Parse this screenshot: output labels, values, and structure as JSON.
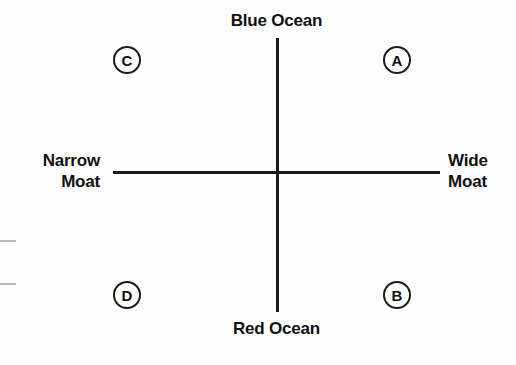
{
  "chart_data": {
    "type": "scatter",
    "title": "",
    "subtitle": "",
    "xlabel": "",
    "ylabel": "",
    "grid": false,
    "legend_position": "none",
    "axes": {
      "horizontal": {
        "left_pole": "Narrow\nMoat",
        "right_pole": "Wide\nMoat"
      },
      "vertical": {
        "top_pole": "Blue Ocean",
        "bottom_pole": "Red Ocean"
      }
    },
    "quadrant_markers": [
      {
        "label": "A",
        "quadrant": "top-right",
        "x": 0.62,
        "y": 0.58
      },
      {
        "label": "B",
        "quadrant": "bottom-right",
        "x": 0.62,
        "y": -0.52
      },
      {
        "label": "C",
        "quadrant": "top-left",
        "x": -0.62,
        "y": 0.58
      },
      {
        "label": "D",
        "quadrant": "bottom-left",
        "x": -0.62,
        "y": -0.52
      }
    ],
    "edge_ticks": 2
  },
  "matrix": {
    "poles": {
      "top": "Blue Ocean",
      "bottom": "Red Ocean",
      "left": "Narrow\nMoat",
      "right": "Wide\nMoat"
    },
    "markers": {
      "a": "A",
      "b": "B",
      "c": "C",
      "d": "D"
    }
  },
  "colors": {
    "axis": "#1a1a1a",
    "text": "#111111",
    "background": "#fdfdfd",
    "edge_tick": "#b9b9b9"
  }
}
